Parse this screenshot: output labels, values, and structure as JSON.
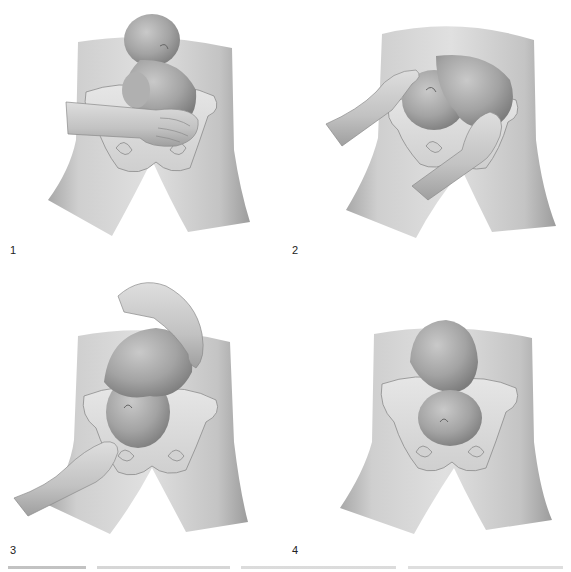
{
  "figure": {
    "panels": [
      {
        "label": "1",
        "description": "Fetus in breech presentation; operator's hand lifts the breech out of the pelvis"
      },
      {
        "label": "2",
        "description": "Both hands rotate the fetus — one pushing the head, one the breech"
      },
      {
        "label": "3",
        "description": "Forward roll continues; head guided toward the pelvis, breech pushed upward"
      },
      {
        "label": "4",
        "description": "Fetus in cephalic (vertex) presentation, head engaged in the pelvis"
      }
    ],
    "caption_visible": false
  },
  "colors": {
    "background": "#ffffff",
    "skin_light": "#d9d9d9",
    "skin_mid": "#b5b5b5",
    "skin_dark": "#8c8c8c",
    "bone": "#e2e2e2",
    "outline": "#7a7a7a",
    "label": "#222222"
  }
}
